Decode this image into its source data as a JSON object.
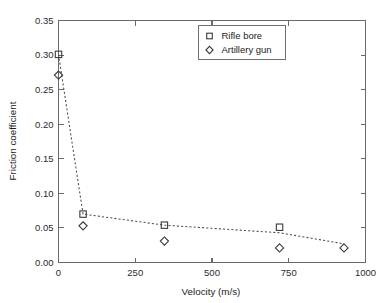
{
  "chart_data": {
    "type": "scatter",
    "title": "",
    "xlabel": "Velocity (m/s)",
    "ylabel": "Friction coefficient",
    "xlim": [
      0,
      1000
    ],
    "ylim": [
      0,
      0.35
    ],
    "xticks": [
      0,
      250,
      500,
      750,
      1000
    ],
    "xticklabels": [
      "0",
      "250",
      "500",
      "750",
      "1000"
    ],
    "yticks": [
      0.0,
      0.05,
      0.1,
      0.15,
      0.2,
      0.25,
      0.3,
      0.35
    ],
    "yticklabels": [
      "0.00",
      "0.05",
      "0.10",
      "0.15",
      "0.20",
      "0.25",
      "0.30",
      "0.35"
    ],
    "grid": false,
    "frame": "box",
    "legend_position": "upper center-right",
    "series": [
      {
        "name": "Rifle bore",
        "marker": "square",
        "x": [
          0,
          80,
          345,
          720
        ],
        "y": [
          0.301,
          0.07,
          0.054,
          0.051
        ]
      },
      {
        "name": "Artillery gun",
        "marker": "diamond",
        "x": [
          0,
          80,
          345,
          720,
          930
        ],
        "y": [
          0.271,
          0.053,
          0.031,
          0.021,
          0.021
        ]
      }
    ],
    "trend_line": {
      "style": "dotted",
      "x": [
        0,
        80,
        345,
        720,
        930
      ],
      "y": [
        0.301,
        0.07,
        0.054,
        0.043,
        0.027
      ]
    },
    "colors": {
      "marker_stroke": "#3a3a3a",
      "line": "#4d4d4d",
      "axis": "#6a6a6a",
      "text": "#1d1d1d",
      "background": "#ffffff"
    }
  },
  "legend": {
    "entries": [
      {
        "label": "Rifle bore",
        "marker": "square"
      },
      {
        "label": "Artillery gun",
        "marker": "diamond"
      }
    ]
  }
}
